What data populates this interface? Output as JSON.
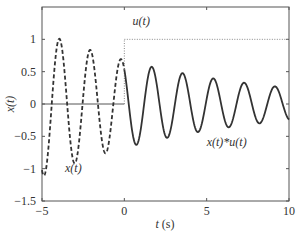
{
  "chart_data": {
    "type": "line",
    "title": "",
    "xlabel": "t (s)",
    "ylabel": "x(t)",
    "xlim": [
      -5,
      10
    ],
    "ylim": [
      -1.5,
      1.5
    ],
    "grid": false,
    "xticks": [
      -5,
      0,
      5,
      10
    ],
    "xtick_labels": [
      "−5",
      "0",
      "5",
      "10"
    ],
    "yticks": [
      -1.5,
      -1,
      -0.5,
      0,
      0.5,
      1
    ],
    "ytick_labels": [
      "−1.5",
      "−1",
      "−0.5",
      "0",
      "0.5",
      "1"
    ],
    "series": [
      {
        "name": "x(t)",
        "style": "dashed",
        "color": "#333333",
        "domain": [
          -5,
          0
        ],
        "model": "0.68*exp(-0.1*t)*cos(3.36*(t+0.2))",
        "peaks": [
          {
            "t": -4.0,
            "v": 1.0
          },
          {
            "t": -2.1,
            "v": 0.82
          },
          {
            "t": -0.2,
            "v": 0.68
          }
        ],
        "troughs": [
          {
            "t": -5.0,
            "v": -1.12
          },
          {
            "t": -3.1,
            "v": -0.95
          },
          {
            "t": -1.2,
            "v": -0.8
          }
        ]
      },
      {
        "name": "x(t)*u(t)",
        "style": "solid",
        "color": "#333333",
        "domain": [
          0,
          10
        ],
        "model": "0.68*exp(-0.1*t)*cos(3.36*(t+0.2))",
        "peaks": [
          {
            "t": 1.6,
            "v": 0.58
          },
          {
            "t": 3.4,
            "v": 0.48
          },
          {
            "t": 5.2,
            "v": 0.4
          },
          {
            "t": 7.2,
            "v": 0.34
          },
          {
            "t": 9.1,
            "v": 0.28
          }
        ],
        "troughs": [
          {
            "t": 0.7,
            "v": -0.63
          },
          {
            "t": 2.5,
            "v": -0.51
          },
          {
            "t": 4.4,
            "v": -0.4
          }
        ]
      },
      {
        "name": "u(t)",
        "style": "step",
        "color": "#555555",
        "points": [
          [
            -5,
            0
          ],
          [
            0,
            0
          ],
          [
            0,
            1
          ],
          [
            10,
            1
          ]
        ]
      }
    ],
    "annotations": [
      {
        "text": "u(t)",
        "t": 0.5,
        "v": 1.22
      },
      {
        "text": "x(t)",
        "t": -3.6,
        "v": -1.05
      },
      {
        "text": "x(t)*u(t)",
        "t": 5.0,
        "v": -0.65
      }
    ],
    "model_params": {
      "amplitude": 0.68,
      "decay": 0.1,
      "omega": 3.36,
      "phase_shift": 0.2
    }
  }
}
